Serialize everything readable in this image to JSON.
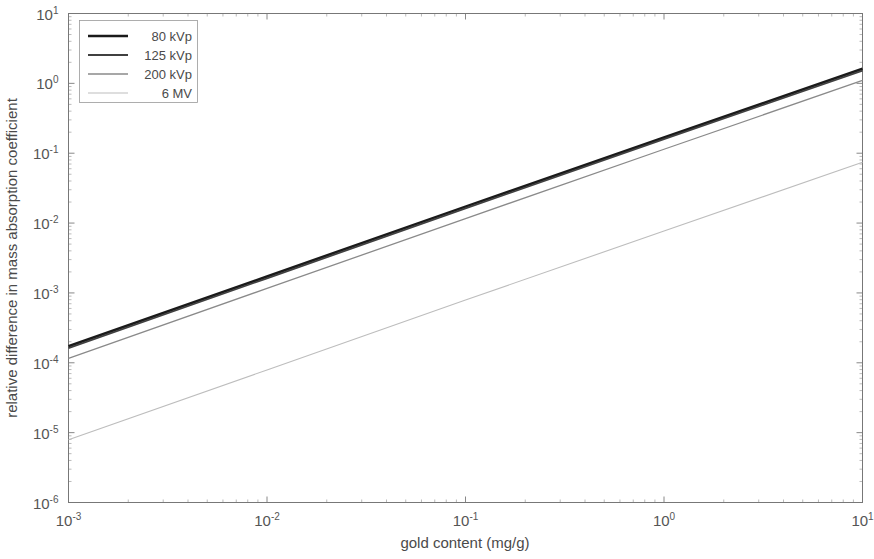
{
  "chart_data": {
    "type": "line",
    "title": "",
    "xlabel": "gold content (mg/g)",
    "ylabel": "relative  difference in mass absorption coefficient",
    "xscale": "log",
    "yscale": "log",
    "xlim": [
      0.001,
      10
    ],
    "ylim": [
      1e-06,
      10
    ],
    "grid": false,
    "legend_position": "top-left",
    "x_tick_labels": [
      "10-3",
      "10-2",
      "10-1",
      "100",
      "101"
    ],
    "x_tick_mantissa": [
      "10",
      "10",
      "10",
      "10",
      "10"
    ],
    "x_tick_exponents": [
      "-3",
      "-2",
      "-1",
      "0",
      "1"
    ],
    "x_tick_values": [
      0.001,
      0.01,
      0.1,
      1,
      10
    ],
    "y_tick_mantissa": [
      "10",
      "10",
      "10",
      "10",
      "10",
      "10",
      "10",
      "10"
    ],
    "y_tick_exponents": [
      "1",
      "0",
      "-1",
      "-2",
      "-3",
      "-4",
      "-5",
      "-6"
    ],
    "y_tick_values": [
      10,
      1,
      0.1,
      0.01,
      0.001,
      0.0001,
      1e-05,
      1e-06
    ],
    "x": [
      0.001,
      0.01,
      0.1,
      1,
      10
    ],
    "series": [
      {
        "name": "80 kVp",
        "color": "#1a1a1a",
        "width": 2.6,
        "values": [
          0.000172,
          0.00172,
          0.0172,
          0.168,
          1.62
        ]
      },
      {
        "name": "125 kVp",
        "color": "#404040",
        "width": 1.8,
        "values": [
          0.000162,
          0.00162,
          0.0162,
          0.159,
          1.52
        ]
      },
      {
        "name": "200 kVp",
        "color": "#8a8a8a",
        "width": 1.3,
        "values": [
          0.000116,
          0.00116,
          0.0116,
          0.114,
          1.1
        ]
      },
      {
        "name": "6 MV",
        "color": "#bdbdbd",
        "width": 1.1,
        "values": [
          7.9e-06,
          7.9e-05,
          0.00079,
          0.0077,
          0.074
        ]
      }
    ]
  },
  "axes": {
    "x_title": "gold content (mg/g)",
    "y_title": "relative  difference in mass absorption coefficient"
  },
  "legend": {
    "entries": [
      {
        "label": "80 kVp"
      },
      {
        "label": "125 kVp"
      },
      {
        "label": "200 kVp"
      },
      {
        "label": "6 MV"
      }
    ]
  }
}
